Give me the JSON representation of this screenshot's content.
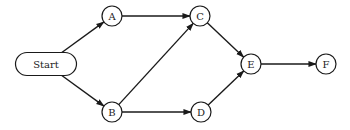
{
  "diagram": {
    "type": "directed-graph",
    "nodes": [
      {
        "id": "start",
        "label": "Start",
        "shape": "pill",
        "cx": 46,
        "cy": 64,
        "w": 61,
        "h": 23
      },
      {
        "id": "A",
        "label": "A",
        "shape": "circle",
        "cx": 112,
        "cy": 16,
        "r": 10
      },
      {
        "id": "B",
        "label": "B",
        "shape": "circle",
        "cx": 112,
        "cy": 112,
        "r": 10
      },
      {
        "id": "C",
        "label": "C",
        "shape": "circle",
        "cx": 200,
        "cy": 16,
        "r": 10
      },
      {
        "id": "D",
        "label": "D",
        "shape": "circle",
        "cx": 201,
        "cy": 112,
        "r": 10
      },
      {
        "id": "E",
        "label": "E",
        "shape": "circle",
        "cx": 251,
        "cy": 64,
        "r": 10
      },
      {
        "id": "F",
        "label": "F",
        "shape": "circle",
        "cx": 326,
        "cy": 64,
        "r": 10
      }
    ],
    "edges": [
      {
        "from": "start",
        "to": "A"
      },
      {
        "from": "start",
        "to": "B"
      },
      {
        "from": "A",
        "to": "C"
      },
      {
        "from": "B",
        "to": "C"
      },
      {
        "from": "B",
        "to": "D"
      },
      {
        "from": "C",
        "to": "E"
      },
      {
        "from": "D",
        "to": "E"
      },
      {
        "from": "E",
        "to": "F"
      }
    ],
    "colors": {
      "stroke": "#1a1a1a",
      "fill": "#ffffff",
      "text": "#222222"
    }
  }
}
